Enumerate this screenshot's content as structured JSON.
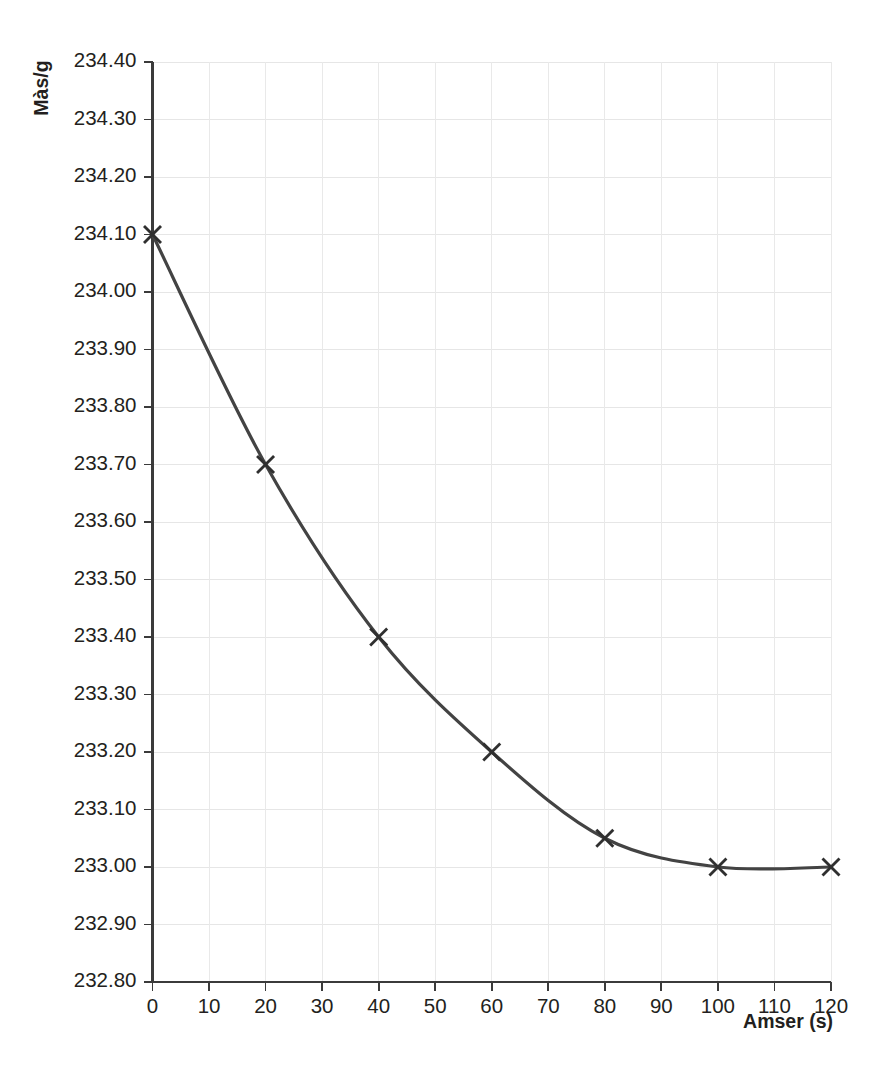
{
  "chart_data": {
    "type": "line",
    "title": "",
    "subtitle": "",
    "xlabel": "Amser (s)",
    "ylabel": "Màs/g",
    "x": [
      0,
      20,
      40,
      60,
      80,
      100,
      120
    ],
    "values": [
      234.1,
      233.7,
      233.4,
      233.2,
      233.05,
      233.0,
      233.0
    ],
    "series": [
      {
        "name": "Màs",
        "x": [
          0,
          20,
          40,
          60,
          80,
          100,
          120
        ],
        "values": [
          234.1,
          233.7,
          233.4,
          233.2,
          233.05,
          233.0,
          233.0
        ]
      }
    ],
    "xlim": [
      0,
      120
    ],
    "ylim": [
      232.8,
      234.4
    ],
    "x_tick_step": 10,
    "y_tick_step": 0.1,
    "xticks": [
      0,
      10,
      20,
      30,
      40,
      50,
      60,
      70,
      80,
      90,
      100,
      110,
      120
    ],
    "xtick_labels": [
      "0",
      "10",
      "20",
      "30",
      "40",
      "50",
      "60",
      "70",
      "80",
      "90",
      "100",
      "110",
      "120"
    ],
    "yticks": [
      232.8,
      232.9,
      233.0,
      233.1,
      233.2,
      233.3,
      233.4,
      233.5,
      233.6,
      233.7,
      233.8,
      233.9,
      234.0,
      234.1,
      234.2,
      234.3,
      234.4
    ],
    "ytick_labels": [
      "232.80",
      "232.90",
      "233.00",
      "233.10",
      "233.20",
      "233.30",
      "233.40",
      "233.50",
      "233.60",
      "233.70",
      "233.80",
      "233.90",
      "234.00",
      "234.10",
      "234.20",
      "234.30",
      "234.40"
    ],
    "grid": {
      "horizontal": true,
      "vertical": true,
      "horizontal_step": 0.1,
      "vertical_step": 10
    },
    "legend": {
      "visible": false,
      "position": "none",
      "entries": []
    },
    "marker": "x-cross",
    "line_style": "smooth-solid",
    "colors": {
      "line": "#434343",
      "marker": "#2f2f2f",
      "grid_horizontal": "#e6e6e6",
      "grid_vertical": "#e9e9e9",
      "axis": "#3b3b3b",
      "text": "#231f20",
      "background": "#ffffff"
    },
    "annotations": []
  }
}
